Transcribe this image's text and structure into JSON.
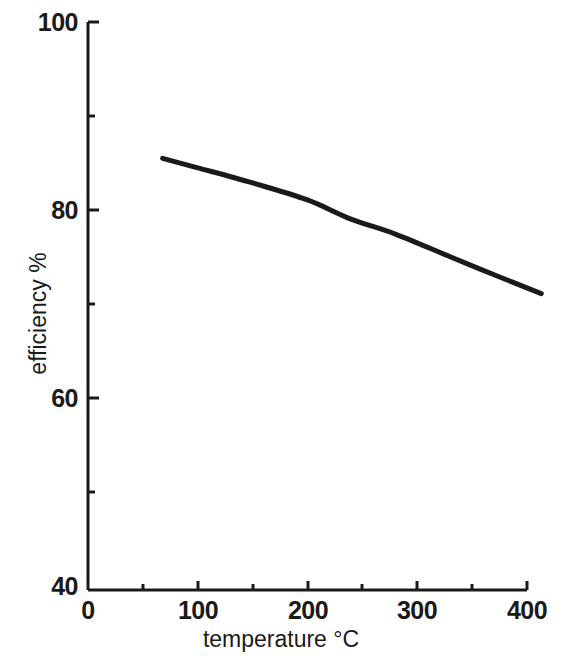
{
  "chart_data": {
    "type": "line",
    "title": "",
    "xlabel": "temperature °C",
    "ylabel": "efficiency %",
    "xlim": [
      0,
      400
    ],
    "ylim": [
      40,
      100
    ],
    "grid": false,
    "legend": null,
    "x_ticks": [
      0,
      100,
      200,
      300,
      400
    ],
    "x_tick_labels": [
      "0",
      "100",
      "200",
      "300",
      "400"
    ],
    "x_minor_ticks": [
      50,
      150,
      250,
      350
    ],
    "y_ticks": [
      40,
      60,
      80,
      100
    ],
    "y_tick_labels": [
      "40",
      "60",
      "80",
      "100"
    ],
    "y_minor_ticks": [
      50,
      70,
      90
    ],
    "series": [
      {
        "name": "efficiency",
        "color": "#1a1a1a",
        "x": [
          68,
          100,
          150,
          200,
          239,
          280,
          330,
          370,
          413
        ],
        "values": [
          85.6,
          84.6,
          83.0,
          81.2,
          79.2,
          77.6,
          75.2,
          73.3,
          71.3
        ]
      }
    ]
  },
  "axes": {
    "y_label_text": "efficiency %",
    "x_label_text": "temperature °C",
    "y_labels": [
      {
        "value": "100",
        "top": 8
      },
      {
        "value": "80",
        "top": 196
      },
      {
        "value": "60",
        "top": 384
      },
      {
        "value": "40",
        "top": 572
      }
    ],
    "x_labels": [
      {
        "value": "0",
        "left": 88
      },
      {
        "value": "100",
        "left": 198
      },
      {
        "value": "200",
        "left": 308
      },
      {
        "value": "300",
        "left": 417
      },
      {
        "value": "400",
        "left": 527
      }
    ]
  },
  "colors": {
    "axis": "#1a1a1a",
    "curve": "#1a1a1a",
    "background": "#ffffff"
  }
}
